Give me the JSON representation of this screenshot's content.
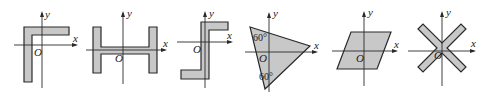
{
  "figures": [
    {
      "id": "fig1",
      "shape": "L-shape (inverted, corner top-left)",
      "labels": {
        "x": "x",
        "y": "y",
        "origin": "O"
      }
    },
    {
      "id": "fig2",
      "shape": "H-shape (I-beam rotated)",
      "labels": {
        "x": "x",
        "y": "y",
        "origin": "O"
      }
    },
    {
      "id": "fig3",
      "shape": "Z-shape (S-bar)",
      "labels": {
        "x": "x",
        "y": "y",
        "origin": "O"
      }
    },
    {
      "id": "fig4",
      "shape": "triangle",
      "labels": {
        "x": "x",
        "y": "y",
        "origin": "O",
        "angle_top": "60°",
        "angle_bottom": "60°"
      }
    },
    {
      "id": "fig5",
      "shape": "parallelogram",
      "labels": {
        "x": "x",
        "y": "y",
        "origin": "O"
      }
    },
    {
      "id": "fig6",
      "shape": "X-shape (cross)",
      "labels": {
        "x": "x",
        "y": "y",
        "origin": "O"
      }
    }
  ],
  "colors": {
    "fill": "#c8c8c8",
    "stroke": "#2a2a2a",
    "background": "#ffffff"
  }
}
